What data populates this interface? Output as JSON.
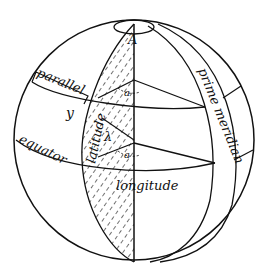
{
  "diagram": {
    "type": "globe-coordinates",
    "labels": {
      "pole": "A",
      "parallel": "parallel",
      "equator": "equator",
      "latitude": "latitude",
      "longitude": "longitude",
      "prime_meridian": "prime meridian",
      "angle_a_upper": "a",
      "angle_a_lower": "a",
      "y": "y",
      "lambda": "λ"
    },
    "colors": {
      "ink": "#111111",
      "background": "#ffffff"
    }
  }
}
